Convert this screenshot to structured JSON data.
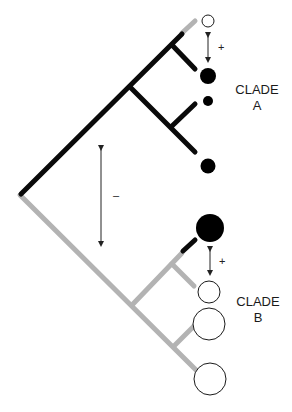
{
  "diagram": {
    "type": "phylogenetic-tree",
    "colors": {
      "clade_a_branch": "#0a0a0a",
      "clade_b_branch": "#b3b3b3",
      "filled_node": "#000000",
      "open_node_fill": "#ffffff",
      "open_node_stroke": "#1a1a1a",
      "arrow": "#222222"
    },
    "clades": [
      {
        "name": "A",
        "label_line1": "CLADE",
        "label_line2": "A",
        "tips": [
          {
            "state": "open",
            "size": "small"
          },
          {
            "state": "filled",
            "size": "medium"
          },
          {
            "state": "filled",
            "size": "small"
          },
          {
            "state": "filled",
            "size": "medium"
          }
        ]
      },
      {
        "name": "B",
        "label_line1": "CLADE",
        "label_line2": "B",
        "tips": [
          {
            "state": "filled",
            "size": "large"
          },
          {
            "state": "open",
            "size": "medium"
          },
          {
            "state": "open",
            "size": "large"
          },
          {
            "state": "open",
            "size": "large"
          }
        ]
      }
    ],
    "annotations": {
      "between_clades": "–",
      "within_clade_a": "+",
      "within_clade_b": "+"
    }
  }
}
